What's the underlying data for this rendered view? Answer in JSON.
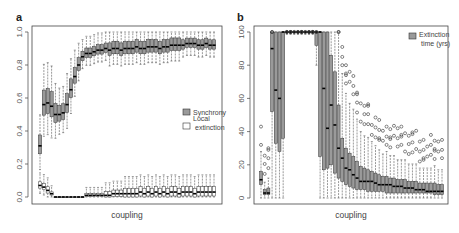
{
  "chart_data": [
    {
      "panel": "a",
      "type": "boxplot",
      "xlabel": "coupling",
      "ylabel": "",
      "ylim": [
        0,
        1
      ],
      "yticks": [
        "0.0",
        "0.2",
        "0.4",
        "0.6",
        "0.8",
        "1.0"
      ],
      "legend": [
        {
          "label": "Synchrony",
          "fill": "#9a9a9a"
        },
        {
          "label": "Local\nextinction",
          "fill": "#ffffff"
        }
      ],
      "legend_position": "right-middle",
      "series": [
        {
          "name": "Synchrony",
          "fill": "#9a9a9a",
          "medians": [
            0.31,
            0.56,
            0.57,
            0.55,
            0.5,
            0.5,
            0.51,
            0.56,
            0.65,
            0.73,
            0.8,
            0.85,
            0.87,
            0.87,
            0.88,
            0.89,
            0.89,
            0.9,
            0.89,
            0.9,
            0.9,
            0.89,
            0.9,
            0.9,
            0.9,
            0.91,
            0.9,
            0.9,
            0.91,
            0.91,
            0.91,
            0.9,
            0.91,
            0.91,
            0.92,
            0.92,
            0.92,
            0.92,
            0.93,
            0.93,
            0.93,
            0.92,
            0.92,
            0.93,
            0.92,
            0.92
          ],
          "spread": [
            0.06,
            0.08,
            0.08,
            0.08,
            0.06,
            0.05,
            0.05,
            0.06,
            0.06,
            0.05,
            0.04,
            0.03,
            0.03,
            0.03,
            0.03,
            0.03,
            0.03,
            0.03,
            0.04,
            0.04,
            0.04,
            0.04,
            0.04,
            0.04,
            0.04,
            0.04,
            0.04,
            0.04,
            0.04,
            0.04,
            0.04,
            0.04,
            0.04,
            0.04,
            0.04,
            0.04,
            0.04,
            0.03,
            0.03,
            0.03,
            0.03,
            0.03,
            0.03,
            0.03,
            0.03,
            0.03
          ]
        },
        {
          "name": "Local extinction",
          "fill": "#ffffff",
          "medians": [
            0.07,
            0.06,
            0.04,
            0.02,
            0.0,
            0.0,
            0.0,
            0.0,
            0.0,
            0.0,
            0.0,
            0.0,
            0.01,
            0.01,
            0.01,
            0.01,
            0.01,
            0.01,
            0.01,
            0.02,
            0.02,
            0.02,
            0.02,
            0.02,
            0.02,
            0.02,
            0.03,
            0.02,
            0.03,
            0.02,
            0.03,
            0.02,
            0.03,
            0.02,
            0.03,
            0.03,
            0.02,
            0.03,
            0.03,
            0.03,
            0.02,
            0.03,
            0.03,
            0.03,
            0.03,
            0.03
          ],
          "spread": [
            0.02,
            0.02,
            0.02,
            0.01,
            0.0,
            0.0,
            0.0,
            0.0,
            0.0,
            0.0,
            0.0,
            0.0,
            0.01,
            0.01,
            0.01,
            0.01,
            0.01,
            0.02,
            0.02,
            0.02,
            0.02,
            0.02,
            0.03,
            0.03,
            0.03,
            0.03,
            0.03,
            0.03,
            0.03,
            0.03,
            0.03,
            0.03,
            0.03,
            0.03,
            0.03,
            0.03,
            0.03,
            0.03,
            0.03,
            0.03,
            0.03,
            0.03,
            0.03,
            0.03,
            0.03,
            0.03
          ]
        }
      ]
    },
    {
      "panel": "b",
      "type": "boxplot",
      "xlabel": "coupling",
      "ylabel": "",
      "ylim": [
        0,
        100
      ],
      "yticks": [
        "0",
        "20",
        "40",
        "60",
        "80",
        "100"
      ],
      "legend": [
        {
          "label": "Extinction\ntime (yrs)",
          "fill": "#9a9a9a"
        }
      ],
      "legend_position": "top-right",
      "series": [
        {
          "name": "Extinction time (yrs)",
          "fill": "#9a9a9a",
          "medians": [
            11,
            3,
            3,
            90,
            65,
            60,
            100,
            100,
            100,
            100,
            100,
            100,
            100,
            100,
            100,
            100,
            100,
            66,
            42,
            56,
            44,
            30,
            24,
            18,
            17,
            14,
            12,
            10,
            10,
            10,
            10,
            9,
            8,
            8,
            8,
            8,
            7,
            7,
            7,
            6,
            6,
            6,
            5,
            5,
            5,
            4,
            4,
            4,
            4,
            4
          ],
          "q1": [
            8,
            2,
            2,
            52,
            33,
            28,
            36,
            100,
            100,
            100,
            100,
            100,
            100,
            100,
            100,
            92,
            25,
            17,
            18,
            20,
            15,
            12,
            10,
            8,
            7,
            6,
            5,
            5,
            5,
            4,
            4,
            4,
            4,
            4,
            3,
            3,
            3,
            3,
            3,
            3,
            3,
            3,
            3,
            3,
            3,
            3,
            3,
            2,
            2,
            2
          ],
          "q3": [
            16,
            5,
            6,
            100,
            100,
            100,
            100,
            100,
            100,
            100,
            100,
            100,
            100,
            100,
            100,
            100,
            100,
            100,
            100,
            86,
            76,
            56,
            36,
            30,
            27,
            25,
            22,
            19,
            18,
            17,
            16,
            15,
            14,
            13,
            13,
            12,
            12,
            11,
            11,
            11,
            10,
            10,
            10,
            9,
            9,
            9,
            9,
            9,
            8,
            8
          ]
        }
      ]
    }
  ],
  "panels": {
    "a": {
      "label": "a",
      "xlabel": "coupling"
    },
    "b": {
      "label": "b",
      "xlabel": "coupling"
    }
  }
}
